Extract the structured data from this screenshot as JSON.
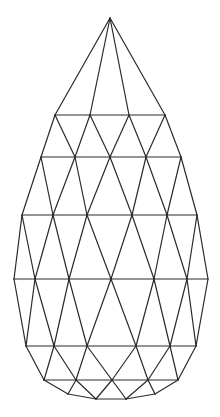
{
  "diagram": {
    "title": "",
    "stroke_color": "#2a2a2a",
    "background": "#ffffff",
    "vertices": {
      "A": [
        110,
        18
      ],
      "r1": [
        [
          55,
          115
        ],
        [
          90,
          115
        ],
        [
          129,
          115
        ],
        [
          165,
          115
        ]
      ],
      "r2": [
        [
          41,
          157
        ],
        [
          75,
          157
        ],
        [
          110,
          157
        ],
        [
          146,
          157
        ],
        [
          181,
          157
        ]
      ],
      "r3": [
        [
          22,
          215
        ],
        [
          53,
          215
        ],
        [
          87,
          215
        ],
        [
          132,
          215
        ],
        [
          167,
          215
        ],
        [
          197,
          215
        ]
      ],
      "r4": [
        [
          14,
          279
        ],
        [
          35,
          279
        ],
        [
          69,
          279
        ],
        [
          111,
          279
        ],
        [
          154,
          279
        ],
        [
          187,
          279
        ],
        [
          208,
          279
        ]
      ],
      "r5": [
        [
          26,
          346
        ],
        [
          54,
          346
        ],
        [
          87,
          346
        ],
        [
          136,
          346
        ],
        [
          170,
          346
        ],
        [
          196,
          346
        ]
      ],
      "r6": [
        [
          44,
          380
        ],
        [
          76,
          380
        ],
        [
          112,
          380
        ],
        [
          148,
          380
        ],
        [
          178,
          380
        ]
      ],
      "r7": [
        [
          68,
          394
        ],
        [
          96,
          399
        ],
        [
          126,
          399
        ],
        [
          155,
          394
        ]
      ]
    },
    "edges": [
      [
        110,
        18,
        55,
        115
      ],
      [
        110,
        18,
        90,
        115
      ],
      [
        110,
        18,
        129,
        115
      ],
      [
        110,
        18,
        165,
        115
      ],
      [
        55,
        115,
        165,
        115
      ],
      [
        55,
        115,
        41,
        157
      ],
      [
        55,
        115,
        75,
        157
      ],
      [
        90,
        115,
        75,
        157
      ],
      [
        90,
        115,
        110,
        157
      ],
      [
        129,
        115,
        110,
        157
      ],
      [
        129,
        115,
        146,
        157
      ],
      [
        165,
        115,
        146,
        157
      ],
      [
        165,
        115,
        181,
        157
      ],
      [
        41,
        157,
        181,
        157
      ],
      [
        41,
        157,
        22,
        215
      ],
      [
        41,
        157,
        53,
        215
      ],
      [
        75,
        157,
        53,
        215
      ],
      [
        75,
        157,
        87,
        215
      ],
      [
        110,
        157,
        87,
        215
      ],
      [
        110,
        157,
        132,
        215
      ],
      [
        146,
        157,
        132,
        215
      ],
      [
        146,
        157,
        167,
        215
      ],
      [
        181,
        157,
        167,
        215
      ],
      [
        181,
        157,
        197,
        215
      ],
      [
        22,
        215,
        197,
        215
      ],
      [
        22,
        215,
        14,
        279
      ],
      [
        22,
        215,
        35,
        279
      ],
      [
        53,
        215,
        35,
        279
      ],
      [
        53,
        215,
        69,
        279
      ],
      [
        87,
        215,
        69,
        279
      ],
      [
        87,
        215,
        111,
        279
      ],
      [
        132,
        215,
        111,
        279
      ],
      [
        132,
        215,
        154,
        279
      ],
      [
        167,
        215,
        154,
        279
      ],
      [
        167,
        215,
        187,
        279
      ],
      [
        197,
        215,
        187,
        279
      ],
      [
        197,
        215,
        208,
        279
      ],
      [
        14,
        279,
        208,
        279
      ],
      [
        14,
        279,
        26,
        346
      ],
      [
        35,
        279,
        26,
        346
      ],
      [
        35,
        279,
        54,
        346
      ],
      [
        69,
        279,
        54,
        346
      ],
      [
        69,
        279,
        87,
        346
      ],
      [
        111,
        279,
        87,
        346
      ],
      [
        111,
        279,
        136,
        346
      ],
      [
        154,
        279,
        136,
        346
      ],
      [
        154,
        279,
        170,
        346
      ],
      [
        187,
        279,
        170,
        346
      ],
      [
        187,
        279,
        196,
        346
      ],
      [
        208,
        279,
        196,
        346
      ],
      [
        26,
        346,
        196,
        346
      ],
      [
        26,
        346,
        44,
        380
      ],
      [
        54,
        346,
        44,
        380
      ],
      [
        54,
        346,
        76,
        380
      ],
      [
        87,
        346,
        76,
        380
      ],
      [
        87,
        346,
        112,
        380
      ],
      [
        136,
        346,
        112,
        380
      ],
      [
        136,
        346,
        148,
        380
      ],
      [
        170,
        346,
        148,
        380
      ],
      [
        170,
        346,
        178,
        380
      ],
      [
        196,
        346,
        178,
        380
      ],
      [
        44,
        380,
        178,
        380
      ],
      [
        44,
        380,
        68,
        394
      ],
      [
        76,
        380,
        68,
        394
      ],
      [
        76,
        380,
        96,
        399
      ],
      [
        112,
        380,
        96,
        399
      ],
      [
        112,
        380,
        126,
        399
      ],
      [
        148,
        380,
        126,
        399
      ],
      [
        148,
        380,
        155,
        394
      ],
      [
        178,
        380,
        155,
        394
      ],
      [
        68,
        394,
        96,
        399
      ],
      [
        96,
        399,
        126,
        399
      ],
      [
        126,
        399,
        155,
        394
      ]
    ]
  }
}
